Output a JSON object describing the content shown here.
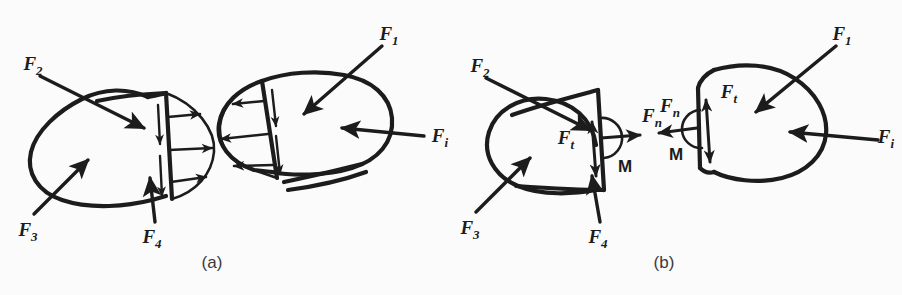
{
  "figure": {
    "background_color": "#fbfbfb",
    "ink_color": "#1c1c1c",
    "width": 902,
    "height": 295
  },
  "panels": [
    {
      "id": "a",
      "caption": "(a)",
      "description": "Two separated halves of a body showing the distributed internal tractions acting on the cut surfaces",
      "bodies": [
        {
          "id": "a-left",
          "name": "left-body",
          "external_loads": [
            "F2",
            "F3",
            "F4"
          ],
          "cut_face_side": "right",
          "distributed_normal_arrows": 3,
          "distributed_shear_arrows": 2
        },
        {
          "id": "a-right",
          "name": "right-body",
          "external_loads": [
            "F1",
            "Fi"
          ],
          "cut_face_side": "left",
          "distributed_normal_arrows": 3,
          "distributed_shear_arrows": 2
        }
      ],
      "labels": [
        {
          "id": "a-F2",
          "base": "F",
          "sub": "2",
          "text": "F2"
        },
        {
          "id": "a-F3",
          "base": "F",
          "sub": "3",
          "text": "F3"
        },
        {
          "id": "a-F4",
          "base": "F",
          "sub": "4",
          "text": "F4"
        },
        {
          "id": "a-F1",
          "base": "F",
          "sub": "1",
          "text": "F1"
        },
        {
          "id": "a-Fi",
          "base": "F",
          "sub": "i",
          "text": "Fi"
        }
      ]
    },
    {
      "id": "b",
      "caption": "(b)",
      "description": "The same two halves with the distributed tractions replaced by their resultants: normal force Fn, tangential force Ft and moment M",
      "bodies": [
        {
          "id": "b-left",
          "name": "left-body",
          "external_loads": [
            "F2",
            "F3",
            "F4"
          ],
          "cut_face_side": "right",
          "resultants": [
            "Fn",
            "Ft",
            "M"
          ]
        },
        {
          "id": "b-right",
          "name": "right-body",
          "external_loads": [
            "F1",
            "Fi"
          ],
          "cut_face_side": "left",
          "resultants": [
            "Fn",
            "Ft",
            "M"
          ]
        }
      ],
      "labels": [
        {
          "id": "b-F2",
          "base": "F",
          "sub": "2",
          "text": "F2"
        },
        {
          "id": "b-F3",
          "base": "F",
          "sub": "3",
          "text": "F3"
        },
        {
          "id": "b-F4",
          "base": "F",
          "sub": "4",
          "text": "F4"
        },
        {
          "id": "b-F1",
          "base": "F",
          "sub": "1",
          "text": "F1"
        },
        {
          "id": "b-Fi",
          "base": "F",
          "sub": "i",
          "text": "Fi"
        },
        {
          "id": "b-Ft-left",
          "base": "F",
          "sub": "t",
          "text": "Ft"
        },
        {
          "id": "b-Fn-left",
          "base": "F",
          "sub": "n",
          "text": "Fn"
        },
        {
          "id": "b-M-left",
          "base": "M",
          "sub": "",
          "text": "M"
        },
        {
          "id": "b-Ft-right",
          "base": "F",
          "sub": "t",
          "text": "Ft"
        },
        {
          "id": "b-Fn-right",
          "base": "F",
          "sub": "n",
          "text": "Fn"
        },
        {
          "id": "b-M-right",
          "base": "M",
          "sub": "",
          "text": "M"
        }
      ]
    }
  ],
  "text": {
    "F_base": "F",
    "M": "M",
    "sub_1": "1",
    "sub_2": "2",
    "sub_3": "3",
    "sub_4": "4",
    "sub_i": "i",
    "sub_n": "n",
    "sub_t": "t",
    "caption_a": "(a)",
    "caption_b": "(b)"
  }
}
